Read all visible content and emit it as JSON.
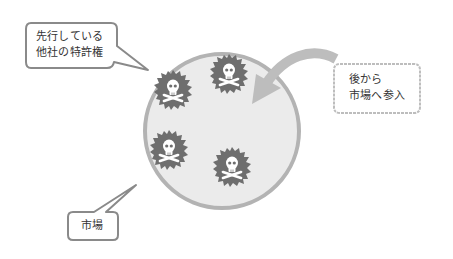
{
  "diagram": {
    "market_label": "市場",
    "incumbent_patents_label": [
      "先行している",
      "他社の特許権"
    ],
    "entrant_label": [
      "後から",
      "市場へ参入"
    ],
    "colors": {
      "market_fill": "#ebebeb",
      "market_stroke": "#b3b3b3",
      "badge_fill": "#6e6e6e",
      "skull": "#ffffff",
      "arrow": "#bdbdbd",
      "bubble_border": "#8a8a8a",
      "text": "#333333"
    },
    "patent_badges": [
      {
        "icon": "skull-crossbones-icon",
        "cx": 173,
        "cy": 90
      },
      {
        "icon": "skull-crossbones-icon",
        "cx": 229,
        "cy": 74
      },
      {
        "icon": "skull-crossbones-icon",
        "cx": 169,
        "cy": 150
      },
      {
        "icon": "skull-crossbones-icon",
        "cx": 232,
        "cy": 167
      }
    ]
  }
}
